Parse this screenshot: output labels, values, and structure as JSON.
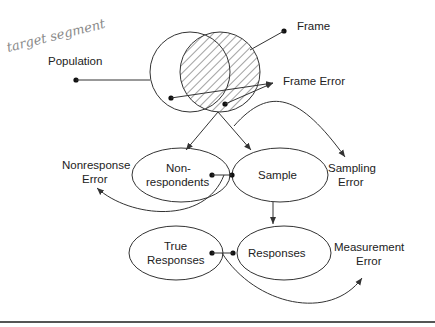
{
  "annotation": {
    "handwritten": "target segment"
  },
  "nodes": {
    "population": "Population",
    "frame": "Frame",
    "frame_error": "Frame Error",
    "nonrespondents_line1": "Non-",
    "nonrespondents_line2": "respondents",
    "sample": "Sample",
    "sampling_error_line1": "Sampling",
    "sampling_error_line2": "Error",
    "nonresponse_error_line1": "Nonresponse",
    "nonresponse_error_line2": "Error",
    "true_responses_line1": "True",
    "true_responses_line2": "Responses",
    "responses": "Responses",
    "measurement_error_line1": "Measurement",
    "measurement_error_line2": "Error"
  },
  "colors": {
    "line": "#333333",
    "text": "#222222",
    "handwriting": "#8a8a8a",
    "rule": "#555555"
  }
}
